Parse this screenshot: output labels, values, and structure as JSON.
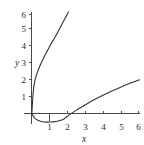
{
  "chart_data": {
    "type": "line",
    "title": "",
    "xlabel": "x",
    "ylabel": "y",
    "xlim": [
      -0.35,
      6.3
    ],
    "ylim": [
      -0.75,
      6.3
    ],
    "grid": false,
    "legend": "none",
    "xticks": [
      1,
      2,
      3,
      4,
      5,
      6
    ],
    "xtick_labels": [
      "1",
      "2",
      "3",
      "4",
      "5",
      "6"
    ],
    "yticks": [
      1,
      2,
      3,
      4,
      5,
      6
    ],
    "ytick_labels": [
      "1",
      "2",
      "3",
      "4",
      "5",
      "6"
    ],
    "line_color": "#333333",
    "axis_color": "#4a4a4a",
    "background": "#ffffff",
    "series": [
      {
        "name": "steep-curve",
        "note": "steep increasing curve from near origin rising to (2, 6)",
        "x": [
          0.02,
          0.05,
          0.08,
          0.12,
          0.18,
          0.25,
          0.35,
          0.5,
          0.7,
          0.9,
          1.1,
          1.3,
          1.5,
          1.7,
          1.9,
          2.05
        ],
        "y": [
          0.05,
          0.55,
          1.05,
          1.5,
          1.9,
          2.2,
          2.5,
          2.9,
          3.35,
          3.75,
          4.15,
          4.5,
          4.9,
          5.3,
          5.7,
          6.0
        ]
      },
      {
        "name": "shallow-curve",
        "note": "curve dipping below x-axis with minimum near x=1.3, crossing zero near x=2.1, rising to (6, 2)",
        "x": [
          0.03,
          0.1,
          0.2,
          0.35,
          0.5,
          0.7,
          0.9,
          1.1,
          1.3,
          1.5,
          1.8,
          2.1,
          2.5,
          3.0,
          3.5,
          4.0,
          4.5,
          5.0,
          5.5,
          6.0
        ],
        "y": [
          -0.02,
          -0.17,
          -0.3,
          -0.4,
          -0.46,
          -0.5,
          -0.51,
          -0.5,
          -0.48,
          -0.44,
          -0.32,
          -0.08,
          0.2,
          0.52,
          0.83,
          1.1,
          1.35,
          1.58,
          1.8,
          2.0
        ]
      }
    ]
  },
  "axes": {
    "y_axis_title": "y",
    "x_axis_title": "x"
  }
}
